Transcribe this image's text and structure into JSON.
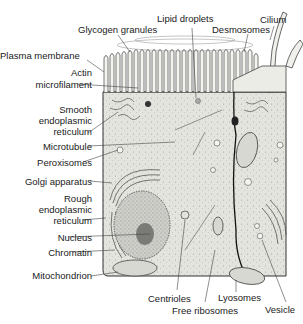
{
  "diagram": {
    "type": "cell-illustration",
    "colors": {
      "cytoplasm": "#e6e6e0",
      "outline": "#333333",
      "leader_line": "#444444",
      "background": "#ffffff"
    },
    "labels_top": [
      {
        "id": "glycogen",
        "text": "Glycogen granules"
      },
      {
        "id": "lipid",
        "text": "Lipid droplets"
      },
      {
        "id": "desmosomes",
        "text": "Desmosomes"
      },
      {
        "id": "cilium",
        "text": "Cilium"
      }
    ],
    "labels_left": [
      {
        "id": "plasma",
        "text": "Plasma membrane"
      },
      {
        "id": "actin1",
        "text": "Actin"
      },
      {
        "id": "actin2",
        "text": "microfilament"
      },
      {
        "id": "ser1",
        "text": "Smooth"
      },
      {
        "id": "ser2",
        "text": "endoplasmic"
      },
      {
        "id": "ser3",
        "text": "reticulum"
      },
      {
        "id": "microtubule",
        "text": "Microtubule"
      },
      {
        "id": "peroxisomes",
        "text": "Peroxisomes"
      },
      {
        "id": "golgi",
        "text": "Golgi apparatus"
      },
      {
        "id": "rer1",
        "text": "Rough"
      },
      {
        "id": "rer2",
        "text": "endoplasmic"
      },
      {
        "id": "rer3",
        "text": "reticulum"
      },
      {
        "id": "nucleus",
        "text": "Nucleus"
      },
      {
        "id": "chromatin",
        "text": "Chromatin"
      },
      {
        "id": "mito",
        "text": "Mitochondrion"
      }
    ],
    "labels_bottom": [
      {
        "id": "centrioles",
        "text": "Centrioles"
      },
      {
        "id": "ribosomes",
        "text": "Free ribosomes"
      },
      {
        "id": "lysosomes",
        "text": "Lyosomes"
      },
      {
        "id": "vesicle",
        "text": "Vesicle"
      }
    ]
  }
}
